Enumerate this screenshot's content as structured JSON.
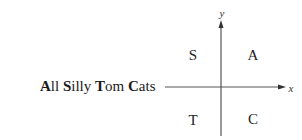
{
  "mnemonic": {
    "words": [
      {
        "initial": "A",
        "rest": "ll"
      },
      {
        "initial": "S",
        "rest": "illy"
      },
      {
        "initial": "T",
        "rest": "om"
      },
      {
        "initial": "C",
        "rest": "ats"
      }
    ],
    "full_text": "All Silly Tom Cats"
  },
  "axes": {
    "x_label": "x",
    "y_label": "y",
    "color": "#555555"
  },
  "quadrants": {
    "top_left": "S",
    "top_right": "A",
    "bottom_left": "T",
    "bottom_right": "C"
  }
}
